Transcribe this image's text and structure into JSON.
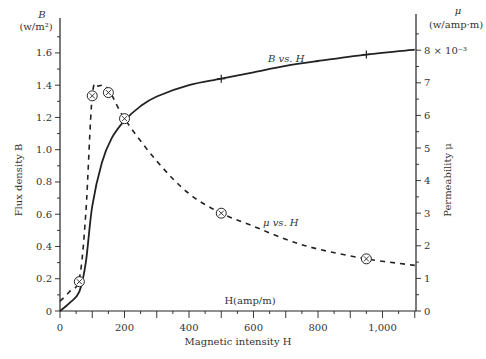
{
  "chart_data": {
    "type": "line",
    "title": "",
    "xlabel": "Magnetic intensity H",
    "x_unit_label": "H(amp/m)",
    "ylabel_left": "Flux density B",
    "ylabel_left_unit": "(w/m²)",
    "ylabel_left_symbol": "B",
    "ylabel_right": "Permeability μ",
    "ylabel_right_unit": "(w/amp·m)",
    "ylabel_right_symbol": "μ",
    "xlim": [
      0,
      1100
    ],
    "ylim_left": [
      0,
      1.7
    ],
    "ylim_right": [
      0,
      8.5
    ],
    "x_ticks": [
      0,
      200,
      400,
      600,
      800,
      1000
    ],
    "x_tick_labels": [
      "0",
      "200",
      "400",
      "600",
      "800",
      "1,000"
    ],
    "y_left_ticks": [
      0,
      0.2,
      0.4,
      0.6,
      0.8,
      1.0,
      1.2,
      1.4,
      1.6
    ],
    "y_left_tick_labels": [
      "0",
      "0.2",
      "0.4",
      "0.6",
      "0.8",
      "1.0",
      "1.2",
      "1.4",
      "1.6"
    ],
    "y_right_ticks": [
      0,
      1,
      2,
      3,
      4,
      5,
      6,
      7,
      8
    ],
    "y_right_tick_labels": [
      "0",
      "1",
      "2",
      "3",
      "4",
      "5",
      "6",
      "7",
      "8 × 10⁻³"
    ],
    "grid": false,
    "series": [
      {
        "name": "B vs. H",
        "axis": "left",
        "style": "solid",
        "marker": "plus",
        "x": [
          0,
          30,
          60,
          80,
          100,
          130,
          160,
          200,
          250,
          300,
          400,
          500,
          600,
          700,
          800,
          950,
          1100
        ],
        "values": [
          0,
          0.05,
          0.12,
          0.3,
          0.65,
          0.92,
          1.07,
          1.18,
          1.27,
          1.33,
          1.4,
          1.44,
          1.48,
          1.52,
          1.55,
          1.59,
          1.62
        ],
        "marked_points": [
          {
            "x": 500,
            "y": 1.44
          },
          {
            "x": 950,
            "y": 1.59
          }
        ]
      },
      {
        "name": "μ vs. H",
        "axis": "right",
        "style": "dashed",
        "marker": "circled-x",
        "x": [
          0,
          30,
          60,
          80,
          100,
          120,
          150,
          200,
          300,
          400,
          500,
          600,
          700,
          800,
          950,
          1100
        ],
        "values": [
          0.3,
          0.6,
          1.0,
          3.0,
          6.6,
          6.9,
          6.8,
          5.9,
          4.6,
          3.6,
          3.0,
          2.6,
          2.2,
          1.9,
          1.6,
          1.4
        ],
        "marked_points": [
          {
            "x": 60,
            "y": 0.9
          },
          {
            "x": 100,
            "y": 6.6
          },
          {
            "x": 150,
            "y": 6.7
          },
          {
            "x": 200,
            "y": 5.9
          },
          {
            "x": 500,
            "y": 3.0
          },
          {
            "x": 950,
            "y": 1.6
          }
        ]
      }
    ],
    "annotations": [
      {
        "text": "B vs. H",
        "x": 660,
        "y_left": 1.55
      },
      {
        "text": "μ vs. H",
        "x": 640,
        "y_right": 2.6
      }
    ]
  }
}
